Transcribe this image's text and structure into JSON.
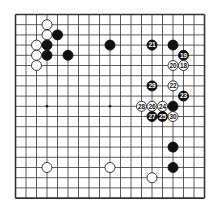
{
  "board": {
    "size": 19,
    "origin_x": 15.5,
    "origin_y": 14.5,
    "spacing_x": 10.5,
    "spacing_y": 10.2,
    "line_color": "#333333",
    "background": "#ffffff",
    "star_points": [
      [
        3,
        9
      ],
      [
        9,
        9
      ]
    ],
    "stones": [
      {
        "col": 3,
        "row": 1,
        "color": "white",
        "label": ""
      },
      {
        "col": 3,
        "row": 2,
        "color": "white",
        "label": ""
      },
      {
        "col": 4,
        "row": 2,
        "color": "black",
        "label": ""
      },
      {
        "col": 2,
        "row": 3,
        "color": "white",
        "label": ""
      },
      {
        "col": 3,
        "row": 3,
        "color": "black",
        "label": ""
      },
      {
        "col": 2,
        "row": 4,
        "color": "white",
        "label": ""
      },
      {
        "col": 3,
        "row": 4,
        "color": "black",
        "label": ""
      },
      {
        "col": 5,
        "row": 4,
        "color": "black",
        "label": ""
      },
      {
        "col": 2,
        "row": 5,
        "color": "white",
        "label": ""
      },
      {
        "col": 9,
        "row": 3,
        "color": "black",
        "label": ""
      },
      {
        "col": 13,
        "row": 3,
        "color": "black",
        "label": "21"
      },
      {
        "col": 15,
        "row": 3,
        "color": "black",
        "label": ""
      },
      {
        "col": 16,
        "row": 4,
        "color": "black",
        "label": "19"
      },
      {
        "col": 15,
        "row": 5,
        "color": "white",
        "label": "20"
      },
      {
        "col": 16,
        "row": 5,
        "color": "white",
        "label": "18"
      },
      {
        "col": 13,
        "row": 7,
        "color": "black",
        "label": "29"
      },
      {
        "col": 15,
        "row": 7,
        "color": "white",
        "label": "22"
      },
      {
        "col": 16,
        "row": 8,
        "color": "black",
        "label": "23"
      },
      {
        "col": 12,
        "row": 9,
        "color": "white",
        "label": "28"
      },
      {
        "col": 13,
        "row": 9,
        "color": "white",
        "label": "26"
      },
      {
        "col": 14,
        "row": 9,
        "color": "white",
        "label": "24"
      },
      {
        "col": 15,
        "row": 9,
        "color": "black",
        "label": ""
      },
      {
        "col": 13,
        "row": 10,
        "color": "black",
        "label": "27"
      },
      {
        "col": 14,
        "row": 10,
        "color": "black",
        "label": "25"
      },
      {
        "col": 15,
        "row": 10,
        "color": "white",
        "label": "30"
      },
      {
        "col": 15,
        "row": 13,
        "color": "black",
        "label": ""
      },
      {
        "col": 15,
        "row": 15,
        "color": "black",
        "label": ""
      },
      {
        "col": 3,
        "row": 15,
        "color": "white",
        "label": ""
      },
      {
        "col": 9,
        "row": 15,
        "color": "white",
        "label": ""
      },
      {
        "col": 13,
        "row": 16,
        "color": "white",
        "label": ""
      }
    ]
  }
}
